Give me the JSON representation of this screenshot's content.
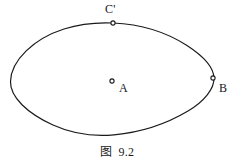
{
  "figure": {
    "caption": "图  9.2",
    "background_color": "#ffffff",
    "stroke_color": "#1a1a1e",
    "curve": {
      "shape_name": "ellipse",
      "center_x": 112,
      "center_y": 79,
      "semi_axis_x": 102,
      "semi_axis_y": 56,
      "stroke_width": 1.2
    },
    "points": [
      {
        "label": "C'",
        "marker": "open-circle",
        "x": 113,
        "y": 23,
        "position_note": "on ellipse, top"
      },
      {
        "label": "A",
        "marker": "open-circle",
        "x": 112,
        "y": 81,
        "position_note": "center of ellipse"
      },
      {
        "label": "B",
        "marker": "open-circle",
        "x": 213,
        "y": 78,
        "position_note": "on ellipse, right"
      }
    ]
  }
}
